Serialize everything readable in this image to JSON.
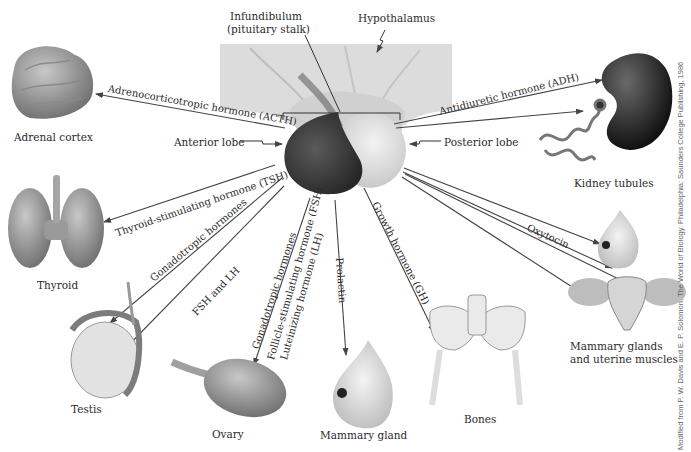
{
  "diagram": {
    "structures": {
      "infundibulum_line1": "Infundibulum",
      "infundibulum_line2": "(pituitary stalk)",
      "hypothalamus": "Hypothalamus",
      "anterior_lobe": "Anterior lobe",
      "posterior_lobe": "Posterior lobe"
    },
    "targets": {
      "adrenal_cortex": "Adrenal cortex",
      "thyroid": "Thyroid",
      "testis": "Testis",
      "ovary": "Ovary",
      "mammary_gland": "Mammary gland",
      "bones": "Bones",
      "kidney_tubules": "Kidney tubules",
      "mammary_uterine_line1": "Mammary glands",
      "mammary_uterine_line2": "and uterine muscles"
    },
    "hormones": {
      "acth": "Adrenocorticotropic hormone (ACTH)",
      "tsh": "Thyroid-stimulating hormone (TSH)",
      "gonadotropic_left": "Gonadotropic hormones",
      "fsh_lh": "FSH and LH",
      "gonadotropic_mid": "Gonadotropic hormones",
      "fsh": "Follicle-stimulating hormone (FSH)",
      "lh": "Luteinizing hormone (LH)",
      "prolactin": "Prolactin",
      "gh": "Growth hormone (GH)",
      "adh": "Antidiuretic hormone (ADH)",
      "oxytocin": "Oxytocin"
    },
    "credit": "Modified from P. W. Davis and E. P. Solomon, The World of Biology. Philadelphia: Saunders College Publishing, 1986",
    "colors": {
      "anterior_lobe": "#3a3a3a",
      "posterior_lobe": "#e6e6e6",
      "hypothalamus": "#d9d9d9",
      "arrow": "#444444"
    }
  }
}
